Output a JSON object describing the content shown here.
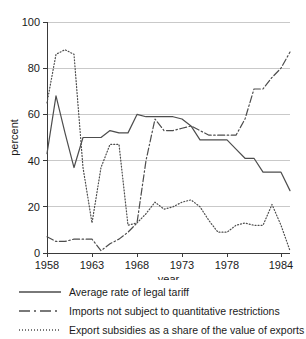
{
  "chart_data": {
    "type": "line",
    "title": "",
    "xlabel": "year",
    "ylabel": "percent",
    "xlim": [
      1958,
      1985
    ],
    "ylim": [
      0,
      100
    ],
    "grid": true,
    "legend_position": "below",
    "xticks": [
      "1958",
      "1963",
      "1968",
      "1973",
      "1978",
      "1984"
    ],
    "xtick_values": [
      1958,
      1963,
      1968,
      1973,
      1978,
      1984
    ],
    "yticks": [
      "0",
      "20",
      "40",
      "60",
      "80",
      "100"
    ],
    "ytick_values": [
      0,
      20,
      40,
      60,
      80,
      100
    ],
    "x": [
      1958,
      1959,
      1960,
      1961,
      1962,
      1963,
      1964,
      1965,
      1966,
      1967,
      1968,
      1969,
      1970,
      1971,
      1972,
      1973,
      1974,
      1975,
      1976,
      1977,
      1978,
      1979,
      1980,
      1981,
      1982,
      1983,
      1984,
      1985
    ],
    "series": [
      {
        "name": "Average rate of legal tariff",
        "style": "solid",
        "color": "#4d4d4d",
        "values": [
          43,
          68,
          52,
          37,
          50,
          50,
          50,
          53,
          52,
          52,
          60,
          59,
          59,
          59,
          59,
          58,
          55,
          49,
          49,
          49,
          49,
          45,
          41,
          41,
          35,
          35,
          35,
          27
        ]
      },
      {
        "name": "Imports not subject to quantitative restrictions",
        "style": "dashdot",
        "color": "#4d4d4d",
        "values": [
          7,
          5,
          5,
          6,
          6,
          6,
          1,
          4,
          6,
          9,
          13,
          40,
          58,
          53,
          53,
          54,
          55,
          53,
          51,
          51,
          51,
          51,
          58,
          71,
          71,
          76,
          80,
          87
        ]
      },
      {
        "name": "Export subsidies as a share of the value of exports",
        "style": "dotted",
        "color": "#4d4d4d",
        "values": [
          65,
          86,
          88,
          86,
          37,
          13,
          37,
          47,
          47,
          12,
          13,
          17,
          22,
          19,
          20,
          22,
          23,
          20,
          14,
          9,
          9,
          12,
          13,
          12,
          12,
          21,
          12,
          1
        ]
      }
    ],
    "annotations": []
  },
  "legend": {
    "items": [
      {
        "label": "Average rate of legal tariff",
        "style": "solid"
      },
      {
        "label": "Imports not subject to quantitative restrictions",
        "style": "dashdot"
      },
      {
        "label": "Export subsidies as a share of the value of exports",
        "style": "dotted"
      }
    ]
  }
}
